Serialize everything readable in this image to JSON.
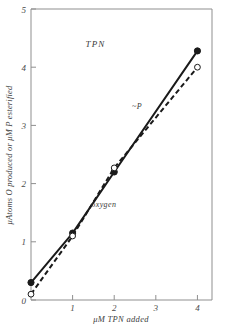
{
  "chart_data": {
    "type": "line",
    "title": "TPN",
    "xlabel": "μM TPN added",
    "ylabel": "μAtoms O produced or μM P esterified",
    "xlim": [
      0,
      4.35
    ],
    "ylim": [
      0,
      5
    ],
    "xticks": [
      1,
      2,
      3,
      4
    ],
    "xticklabels": [
      "1",
      "2",
      "3",
      "4"
    ],
    "yticks": [
      0,
      1,
      2,
      3,
      4,
      5
    ],
    "yticklabels": [
      "0",
      "1",
      "2",
      "3",
      "4",
      "5"
    ],
    "grid": false,
    "legend": "inline-annotations",
    "series": [
      {
        "name": "~P",
        "label": "~P",
        "linestyle": "solid",
        "marker": "filled-circle",
        "color": "#1a1a1a",
        "x": [
          0,
          1,
          2,
          4
        ],
        "y": [
          0.3,
          1.15,
          2.2,
          4.28
        ]
      },
      {
        "name": "oxygen",
        "label": "oxygen",
        "linestyle": "dashed",
        "marker": "open-circle",
        "color": "#1a1a1a",
        "x": [
          0,
          1,
          2,
          4
        ],
        "y": [
          0.1,
          1.1,
          2.27,
          4.0
        ]
      }
    ],
    "annotations": [
      {
        "text": "TPN",
        "x": 1.55,
        "y": 4.35
      },
      {
        "text": "~P",
        "x": 2.55,
        "y": 3.28
      },
      {
        "text": "oxygen",
        "x": 1.75,
        "y": 1.6
      }
    ]
  },
  "figure": {
    "axis_color": "#8a8a8a",
    "ink_color": "#1a1a1a",
    "background": "#ffffff"
  }
}
